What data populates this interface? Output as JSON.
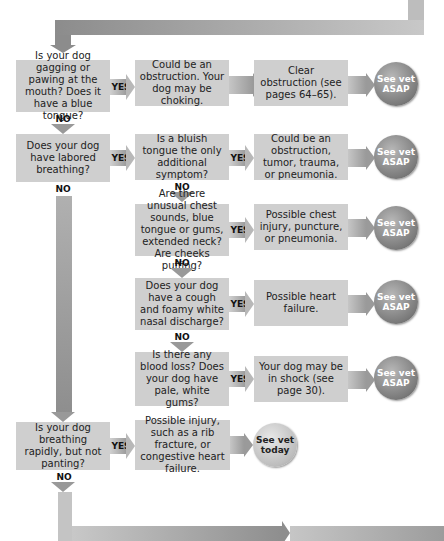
{
  "flow": {
    "yes_label": "YES",
    "no_label": "NO",
    "rows": [
      {
        "question": "Is your dog gagging or pawing at the mouth? Does it have a blue tongue?",
        "finding": "Could be an obstruction. Your dog may be choking.",
        "action": "Clear obstruction (see pages 64–65).",
        "outcome": "See vet ASAP"
      },
      {
        "question": "Does your dog have labored breathing?",
        "finding": "Is a bluish tongue the only additional symptom?",
        "action": "Could be an obstruction, tumor, trauma, or pneumonia.",
        "outcome": "See vet ASAP"
      },
      {
        "question": "Are there unusual chest sounds, blue tongue or gums, extended neck? Are cheeks puffing?",
        "action": "Possible chest injury, puncture, or pneumonia.",
        "outcome": "See vet ASAP"
      },
      {
        "question": "Does your dog have a cough and foamy white nasal discharge?",
        "action": "Possible heart failure.",
        "outcome": "See vet ASAP"
      },
      {
        "question": "Is there any blood loss? Does your dog have pale, white gums?",
        "action": "Your dog may be in shock (see page 30).",
        "outcome": "See vet ASAP"
      },
      {
        "question": "Is your dog breathing rapidly, but not panting?",
        "action": "Possible injury, such as a rib fracture, or congestive heart failure.",
        "outcome": "See vet today"
      }
    ]
  },
  "colors": {
    "box": "#cfcfcf",
    "arrow": "#9a9a9a",
    "urgent_circle": "#7a7a7a",
    "today_circle": "#bdbdbd"
  }
}
